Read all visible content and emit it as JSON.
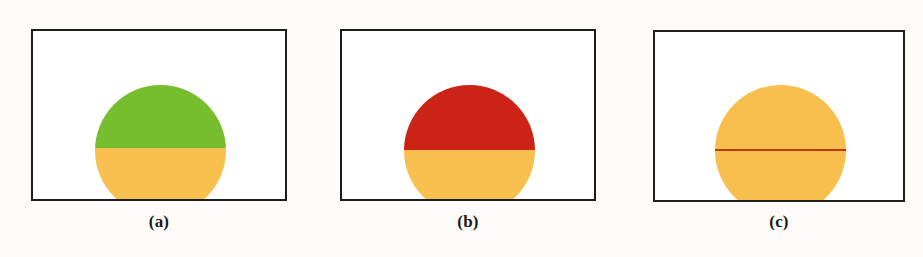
{
  "figure": {
    "background_color": "#fdfcf9",
    "panel_background_color": "#ffffff",
    "panel_border_color": "#1d1d1b",
    "caption_color": "#1a1a18",
    "panels": [
      {
        "id": "a",
        "caption": "(a)",
        "frame": {
          "x": 31,
          "y": 29,
          "width": 256,
          "height": 172
        },
        "circle": {
          "center_x": 128,
          "center_y": 120,
          "diameter": 131,
          "split_offset_y": 63,
          "top_color": "#76be2e",
          "top_color_name": "green",
          "bottom_color": "#f8c04e",
          "bottom_color_name": "amber",
          "divider_line": false
        }
      },
      {
        "id": "b",
        "caption": "(b)",
        "frame": {
          "x": 340,
          "y": 29,
          "width": 256,
          "height": 172
        },
        "circle": {
          "center_x": 128,
          "center_y": 120,
          "diameter": 131,
          "split_offset_y": 65,
          "top_color": "#cb2417",
          "top_color_name": "red",
          "bottom_color": "#f8c04e",
          "bottom_color_name": "amber",
          "divider_line": false
        }
      },
      {
        "id": "c",
        "caption": "(c)",
        "frame": {
          "x": 653,
          "y": 30,
          "width": 252,
          "height": 172
        },
        "circle": {
          "center_x": 126,
          "center_y": 119,
          "diameter": 131,
          "split_offset_y": 65,
          "top_color": "#f7bf4d",
          "top_color_name": "amber",
          "bottom_color": "#f7bf4d",
          "bottom_color_name": "amber",
          "divider_line": true,
          "divider_color": "#c0380f",
          "divider_color_name": "dark-red"
        }
      }
    ]
  }
}
